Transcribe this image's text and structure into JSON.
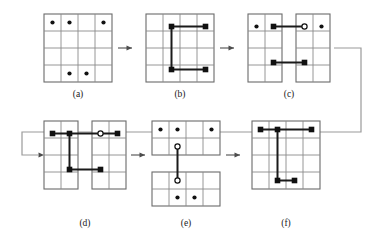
{
  "figure": {
    "panel_count": 6,
    "colors": {
      "grid_line": "#8a8a8a",
      "grid_border": "#6b6b6b",
      "path": "#1a1a1a",
      "node_filled": "#111111",
      "node_open_fill": "#ffffff",
      "arrow": "#4d4d4d",
      "wrap_connector": "#9a9a9a",
      "background": "#ffffff"
    },
    "panels": [
      {
        "id": "a",
        "caption": "(a)",
        "kind": "grid-with-dots",
        "rows": 4,
        "cols": 4,
        "dots": [
          {
            "row": 1,
            "col": 1,
            "type": "filled"
          },
          {
            "row": 1,
            "col": 2,
            "type": "filled"
          },
          {
            "row": 1,
            "col": 4,
            "type": "filled"
          },
          {
            "row": 4,
            "col": 2,
            "type": "filled"
          },
          {
            "row": 4,
            "col": 3,
            "type": "filled"
          }
        ],
        "edges": []
      },
      {
        "id": "b",
        "caption": "(b)",
        "kind": "grid-with-path",
        "rows": 4,
        "cols": 4,
        "dots": [],
        "nodes": [
          {
            "row": 1,
            "col": 2,
            "type": "filled"
          },
          {
            "row": 1,
            "col": 4,
            "type": "filled"
          },
          {
            "row": 4,
            "col": 2,
            "type": "filled"
          },
          {
            "row": 4,
            "col": 4,
            "type": "filled"
          }
        ],
        "edges": [
          {
            "from": [
              1,
              2
            ],
            "to": [
              1,
              4
            ],
            "orientation": "horizontal"
          },
          {
            "from": [
              1,
              2
            ],
            "to": [
              4,
              2
            ],
            "orientation": "vertical"
          },
          {
            "from": [
              4,
              2
            ],
            "to": [
              4,
              4
            ],
            "orientation": "horizontal"
          }
        ]
      },
      {
        "id": "c",
        "caption": "(c)",
        "kind": "grid-split-vertical",
        "rows": 4,
        "cols": 4,
        "split": "vertical-between-col-2-and-3",
        "left_half": {
          "cols": 2,
          "dots": [
            {
              "row": 1,
              "col": 1,
              "type": "filled"
            }
          ],
          "nodes": [
            {
              "row": 1,
              "col": 2,
              "type": "filled"
            },
            {
              "row": 4,
              "col": 2,
              "type": "filled"
            }
          ]
        },
        "right_half": {
          "cols": 2,
          "dots": [
            {
              "row": 1,
              "col": 4,
              "type": "filled"
            }
          ],
          "nodes": [
            {
              "row": 1,
              "col": 3,
              "type": "open"
            },
            {
              "row": 4,
              "col": 3,
              "type": "filled"
            }
          ]
        },
        "bridge_edges": [
          {
            "from": [
              1,
              2
            ],
            "to": [
              1,
              3
            ],
            "orientation": "horizontal"
          },
          {
            "from": [
              4,
              2
            ],
            "to": [
              4,
              3
            ],
            "orientation": "horizontal"
          }
        ]
      },
      {
        "id": "d",
        "caption": "(d)",
        "kind": "grid-split-vertical",
        "rows": 4,
        "cols": 4,
        "split": "vertical-between-col-2-and-3",
        "left_half": {
          "cols": 2,
          "dots": [],
          "nodes": [
            {
              "row": 1,
              "col": 1,
              "type": "filled"
            },
            {
              "row": 1,
              "col": 2,
              "type": "filled"
            },
            {
              "row": 4,
              "col": 2,
              "type": "filled"
            }
          ]
        },
        "right_half": {
          "cols": 2,
          "dots": [],
          "nodes": [
            {
              "row": 1,
              "col": 3,
              "type": "open"
            },
            {
              "row": 1,
              "col": 4,
              "type": "filled"
            },
            {
              "row": 4,
              "col": 3,
              "type": "filled"
            }
          ]
        },
        "edges": [
          {
            "from": [
              1,
              1
            ],
            "to": [
              1,
              2
            ],
            "orientation": "horizontal"
          },
          {
            "from": [
              1,
              2
            ],
            "to": [
              4,
              2
            ],
            "orientation": "vertical"
          },
          {
            "from": [
              1,
              3
            ],
            "to": [
              1,
              4
            ],
            "orientation": "horizontal"
          }
        ],
        "bridge_edges": [
          {
            "from": [
              1,
              2
            ],
            "to": [
              1,
              3
            ],
            "orientation": "horizontal"
          },
          {
            "from": [
              4,
              2
            ],
            "to": [
              4,
              3
            ],
            "orientation": "horizontal"
          }
        ]
      },
      {
        "id": "e",
        "caption": "(e)",
        "kind": "grid-split-horizontal",
        "rows": 4,
        "cols": 4,
        "split": "horizontal-between-row-2-and-3",
        "top_half": {
          "rows": 2,
          "dots": [
            {
              "row": 1,
              "col": 1,
              "type": "filled"
            },
            {
              "row": 1,
              "col": 2,
              "type": "filled"
            },
            {
              "row": 1,
              "col": 4,
              "type": "filled"
            }
          ],
          "nodes": [
            {
              "row": 2,
              "col": 2,
              "type": "open"
            }
          ]
        },
        "bottom_half": {
          "rows": 2,
          "dots": [
            {
              "row": 4,
              "col": 2,
              "type": "filled"
            },
            {
              "row": 4,
              "col": 3,
              "type": "filled"
            }
          ],
          "nodes": [
            {
              "row": 3,
              "col": 2,
              "type": "open"
            }
          ]
        },
        "bridge_edges": [
          {
            "from": [
              2,
              2
            ],
            "to": [
              3,
              2
            ],
            "orientation": "vertical"
          }
        ]
      },
      {
        "id": "f",
        "caption": "(f)",
        "kind": "grid-with-path",
        "rows": 4,
        "cols": 4,
        "dots": [],
        "nodes": [
          {
            "row": 1,
            "col": 1,
            "type": "filled"
          },
          {
            "row": 1,
            "col": 2,
            "type": "filled"
          },
          {
            "row": 1,
            "col": 4,
            "type": "filled"
          },
          {
            "row": 4,
            "col": 2,
            "type": "filled"
          },
          {
            "row": 4,
            "col": 3,
            "type": "filled"
          }
        ],
        "edges": [
          {
            "from": [
              1,
              1
            ],
            "to": [
              1,
              4
            ],
            "orientation": "horizontal"
          },
          {
            "from": [
              1,
              2
            ],
            "to": [
              4,
              2
            ],
            "orientation": "vertical"
          },
          {
            "from": [
              4,
              2
            ],
            "to": [
              4,
              3
            ],
            "orientation": "horizontal"
          }
        ]
      }
    ],
    "arrows": [
      {
        "id": "a-to-b",
        "from_panel": "a",
        "to_panel": "b",
        "direction": "right"
      },
      {
        "id": "b-to-c",
        "from_panel": "b",
        "to_panel": "c",
        "direction": "right"
      },
      {
        "id": "c-to-d",
        "from_panel": "c",
        "to_panel": "d",
        "direction": "wrap-around-right-down-left"
      },
      {
        "id": "d-to-e",
        "from_panel": "d",
        "to_panel": "e",
        "direction": "right"
      },
      {
        "id": "e-to-f",
        "from_panel": "e",
        "to_panel": "f",
        "direction": "right"
      }
    ]
  }
}
